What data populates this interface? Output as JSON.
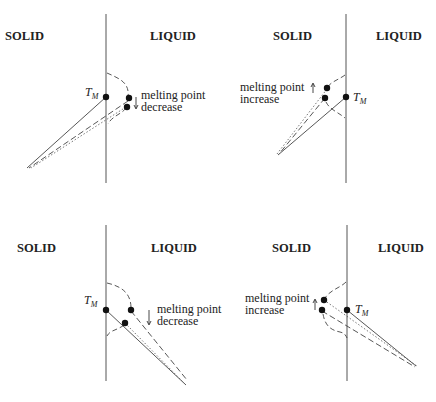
{
  "panels": [
    {
      "id": "top-left",
      "solid_label": "SOLID",
      "liquid_label": "LIQUID",
      "tm_label": "T",
      "tm_sub": "M",
      "note_line1": "melting point",
      "note_line2": "decrease",
      "arrow_direction": "down"
    },
    {
      "id": "top-right",
      "solid_label": "SOLID",
      "liquid_label": "LIQUID",
      "tm_label": "T",
      "tm_sub": "M",
      "note_line1": "melting point",
      "note_line2": "increase",
      "arrow_direction": "up"
    },
    {
      "id": "bottom-left",
      "solid_label": "SOLID",
      "liquid_label": "LIQUID",
      "tm_label": "T",
      "tm_sub": "M",
      "note_line1": "melting point",
      "note_line2": "decrease",
      "arrow_direction": "down"
    },
    {
      "id": "bottom-right",
      "solid_label": "SOLID",
      "liquid_label": "LIQUID",
      "tm_label": "T",
      "tm_sub": "M",
      "note_line1": "melting point",
      "note_line2": "increase",
      "arrow_direction": "up"
    }
  ]
}
